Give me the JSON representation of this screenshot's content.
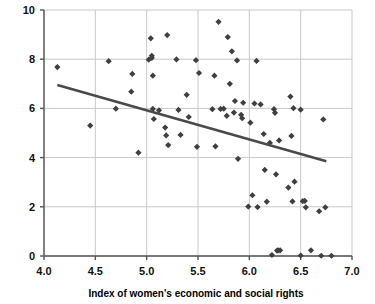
{
  "chart_data": {
    "type": "scatter",
    "title": "",
    "xlabel": "Index of women's economic and social rights",
    "ylabel": "",
    "xlim": [
      4.0,
      7.0
    ],
    "ylim": [
      0,
      10
    ],
    "xticks": [
      "4.0",
      "4.5",
      "5.0",
      "5.5",
      "6.0",
      "6.5",
      "7.0"
    ],
    "xtick_values": [
      4.0,
      4.5,
      5.0,
      5.5,
      6.0,
      6.5,
      7.0
    ],
    "yticks": [
      "0",
      "2",
      "4",
      "6",
      "8",
      "10"
    ],
    "ytick_values": [
      0,
      2,
      4,
      6,
      8,
      10
    ],
    "grid": "both",
    "legend": "none",
    "marker": "diamond",
    "marker_color": "#3f3f3f",
    "grid_color": "#c9c9c9",
    "axis_color": "#555555",
    "trendline": {
      "name": "linear fit",
      "color": "#4a4a4a",
      "x": [
        4.13,
        6.75
      ],
      "y": [
        6.95,
        3.85
      ]
    },
    "points": [
      [
        4.13,
        7.68
      ],
      [
        4.45,
        5.3
      ],
      [
        4.63,
        7.92
      ],
      [
        4.7,
        5.99
      ],
      [
        4.85,
        6.68
      ],
      [
        4.86,
        7.4
      ],
      [
        4.92,
        4.2
      ],
      [
        5.02,
        7.98
      ],
      [
        5.04,
        8.85
      ],
      [
        5.05,
        8.14
      ],
      [
        5.05,
        8.05
      ],
      [
        5.06,
        7.33
      ],
      [
        5.06,
        5.98
      ],
      [
        5.07,
        5.57
      ],
      [
        5.12,
        5.92
      ],
      [
        5.18,
        5.22
      ],
      [
        5.19,
        4.9
      ],
      [
        5.2,
        8.98
      ],
      [
        5.21,
        4.51
      ],
      [
        5.29,
        7.99
      ],
      [
        5.31,
        5.94
      ],
      [
        5.33,
        4.92
      ],
      [
        5.39,
        6.55
      ],
      [
        5.41,
        5.65
      ],
      [
        5.48,
        7.96
      ],
      [
        5.49,
        4.44
      ],
      [
        5.51,
        7.44
      ],
      [
        5.64,
        5.97
      ],
      [
        5.66,
        7.33
      ],
      [
        5.67,
        4.46
      ],
      [
        5.7,
        9.52
      ],
      [
        5.72,
        5.98
      ],
      [
        5.75,
        5.99
      ],
      [
        5.78,
        5.7
      ],
      [
        5.79,
        8.9
      ],
      [
        5.81,
        7.0
      ],
      [
        5.83,
        8.32
      ],
      [
        5.85,
        5.83
      ],
      [
        5.86,
        6.3
      ],
      [
        5.88,
        7.95
      ],
      [
        5.89,
        3.95
      ],
      [
        5.92,
        5.74
      ],
      [
        5.93,
        5.6
      ],
      [
        5.94,
        6.23
      ],
      [
        5.99,
        2.01
      ],
      [
        6.01,
        5.42
      ],
      [
        6.03,
        2.47
      ],
      [
        6.05,
        6.2
      ],
      [
        6.07,
        7.93
      ],
      [
        6.08,
        1.99
      ],
      [
        6.11,
        6.16
      ],
      [
        6.14,
        4.96
      ],
      [
        6.15,
        3.5
      ],
      [
        6.17,
        2.21
      ],
      [
        6.2,
        4.6
      ],
      [
        6.22,
        0.04
      ],
      [
        6.24,
        5.97
      ],
      [
        6.25,
        5.82
      ],
      [
        6.26,
        3.32
      ],
      [
        6.27,
        0.22
      ],
      [
        6.28,
        0.23
      ],
      [
        6.29,
        4.7
      ],
      [
        6.3,
        0.23
      ],
      [
        6.38,
        2.78
      ],
      [
        6.4,
        6.48
      ],
      [
        6.41,
        4.88
      ],
      [
        6.42,
        2.22
      ],
      [
        6.43,
        6.01
      ],
      [
        6.44,
        3.02
      ],
      [
        6.5,
        5.95
      ],
      [
        6.5,
        0.02
      ],
      [
        6.52,
        2.23
      ],
      [
        6.54,
        2.24
      ],
      [
        6.55,
        1.98
      ],
      [
        6.6,
        0.23
      ],
      [
        6.68,
        1.82
      ],
      [
        6.7,
        0.01
      ],
      [
        6.72,
        5.55
      ],
      [
        6.74,
        1.98
      ],
      [
        6.8,
        0.01
      ]
    ]
  },
  "axis": {
    "x_title": "Index of women's economic and social rights"
  }
}
